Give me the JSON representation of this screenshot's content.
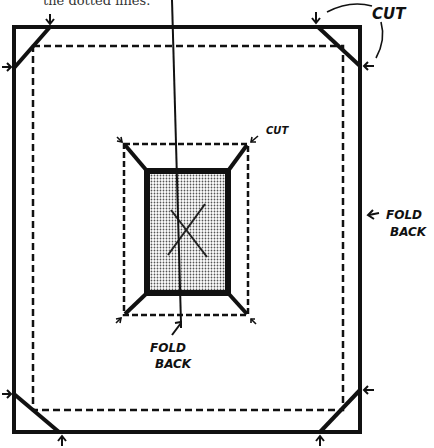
{
  "caption": "the dotted lines.",
  "labels": {
    "cut_top_right": "CUT",
    "cut_center": "CUT",
    "fold_back_right_1": "FOLD",
    "fold_back_right_2": "BACK",
    "fold_back_center_1": "FOLD",
    "fold_back_center_2": "BACK",
    "center_mark": "X"
  },
  "colors": {
    "ink": "#111111",
    "shading": "#9a9a9a",
    "background": "#ffffff"
  }
}
